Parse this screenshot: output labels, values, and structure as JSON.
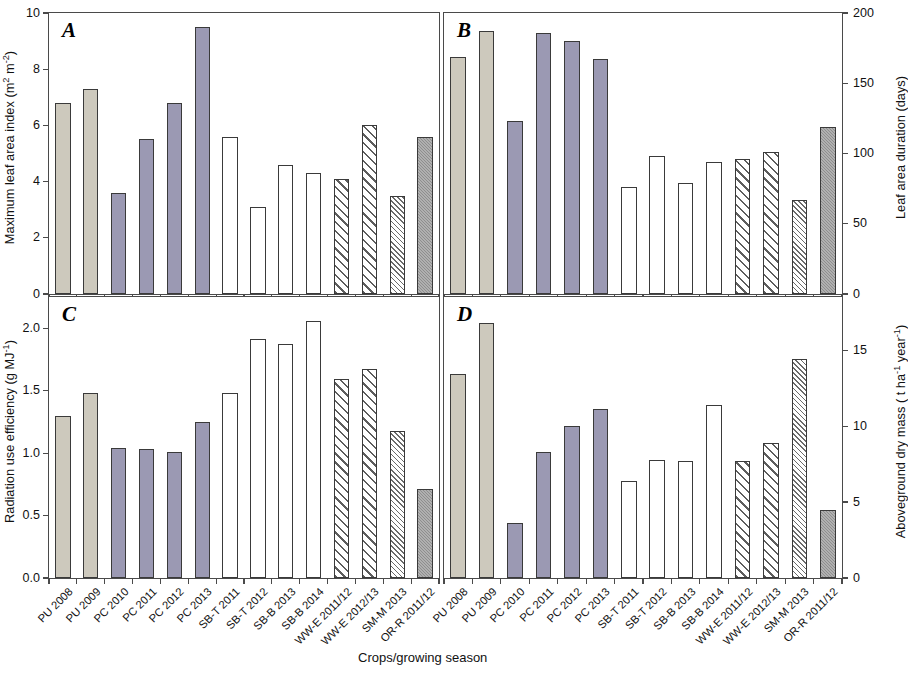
{
  "figure": {
    "xlabel": "Crops/growing season",
    "categories": [
      "PU 2008",
      "PU 2009",
      "PC 2010",
      "PC 2011",
      "PC 2012",
      "PC 2013",
      "SB-T 2011",
      "SB-T 2012",
      "SB-B 2013",
      "SB-B 2014",
      "WW-E 2011/12",
      "WW-E 2012/13",
      "SM-M 2013",
      "OR-R 2011/12"
    ],
    "fills": [
      "beige",
      "beige",
      "purple",
      "purple",
      "purple",
      "purple",
      "white",
      "white",
      "white",
      "white",
      "hatch-coarse",
      "hatch-coarse",
      "hatch-fine",
      "gray"
    ],
    "colors": {
      "beige": "#cdc9bd",
      "purple": "#9b99b3",
      "white": "#ffffff",
      "gray": "#8e8e8e",
      "hatch_coarse": "#5d5d5d",
      "hatch_fine": "#6b6b6b",
      "axis": "#4a4a4a"
    }
  },
  "chart_data": [
    {
      "type": "bar",
      "panel": "A",
      "title": "A",
      "ylabel": "Maximum leaf area index (m2 m-2)",
      "ylabel_html": "Maximum leaf area index (m<sup>2</sup> m<sup>-2</sup>)",
      "xlabel": "Crops/growing season",
      "axis_side": "left",
      "ylim": [
        0,
        10
      ],
      "yticks": [
        0,
        2,
        4,
        6,
        8,
        10
      ],
      "ytick_labels": [
        "0",
        "2",
        "4",
        "6",
        "8",
        "10"
      ],
      "grid": false,
      "legend": "none",
      "categories": [
        "PU 2008",
        "PU 2009",
        "PC 2010",
        "PC 2011",
        "PC 2012",
        "PC 2013",
        "SB-T 2011",
        "SB-T 2012",
        "SB-B 2013",
        "SB-B 2014",
        "WW-E 2011/12",
        "WW-E 2012/13",
        "SM-M 2013",
        "OR-R 2011/12"
      ],
      "values": [
        6.8,
        7.3,
        3.6,
        5.5,
        6.8,
        9.5,
        5.6,
        3.1,
        4.6,
        4.3,
        4.1,
        6.0,
        3.5,
        5.6
      ]
    },
    {
      "type": "bar",
      "panel": "B",
      "title": "B",
      "ylabel": "Leaf area duration (days)",
      "ylabel_html": "Leaf area duration (days)",
      "xlabel": "Crops/growing season",
      "axis_side": "right",
      "ylim": [
        0,
        200
      ],
      "yticks": [
        0,
        50,
        100,
        150,
        200
      ],
      "ytick_labels": [
        "0",
        "50",
        "100",
        "150",
        "200"
      ],
      "grid": false,
      "legend": "none",
      "categories": [
        "PU 2008",
        "PU 2009",
        "PC 2010",
        "PC 2011",
        "PC 2012",
        "PC 2013",
        "SB-T 2011",
        "SB-T 2012",
        "SB-B 2013",
        "SB-B 2014",
        "WW-E 2011/12",
        "WW-E 2012/13",
        "SM-M 2013",
        "OR-R 2011/12"
      ],
      "values": [
        169,
        187,
        123,
        186,
        180,
        167,
        76,
        98,
        79,
        94,
        96,
        101,
        67,
        119
      ]
    },
    {
      "type": "bar",
      "panel": "C",
      "title": "C",
      "ylabel": "Radiation use efficiency (g MJ-1)",
      "ylabel_html": "Radiation use efficiency (g MJ<sup>-1</sup>)",
      "xlabel": "Crops/growing season",
      "axis_side": "left",
      "ylim": [
        0,
        2.25
      ],
      "yticks": [
        0.0,
        0.5,
        1.0,
        1.5,
        2.0
      ],
      "ytick_labels": [
        "0.0",
        "0.5",
        "1.0",
        "1.5",
        "2.0"
      ],
      "grid": false,
      "legend": "none",
      "categories": [
        "PU 2008",
        "PU 2009",
        "PC 2010",
        "PC 2011",
        "PC 2012",
        "PC 2013",
        "SB-T 2011",
        "SB-T 2012",
        "SB-B 2013",
        "SB-B 2014",
        "WW-E 2011/12",
        "WW-E 2012/13",
        "SM-M 2013",
        "OR-R 2011/12"
      ],
      "values": [
        1.3,
        1.48,
        1.04,
        1.03,
        1.01,
        1.25,
        1.48,
        1.91,
        1.87,
        2.06,
        1.59,
        1.67,
        1.18,
        0.71
      ]
    },
    {
      "type": "bar",
      "panel": "D",
      "title": "D",
      "ylabel": "Aboveground dry mass ( t ha-1 year-1)",
      "ylabel_html": "Aboveground dry mass ( t ha<sup>-1</sup> year<sup>-1</sup>)",
      "xlabel": "Crops/growing season",
      "axis_side": "right",
      "ylim": [
        0,
        18.5
      ],
      "yticks": [
        0,
        5,
        10,
        15
      ],
      "ytick_labels": [
        "0",
        "5",
        "10",
        "15"
      ],
      "grid": false,
      "legend": "none",
      "categories": [
        "PU 2008",
        "PU 2009",
        "PC 2010",
        "PC 2011",
        "PC 2012",
        "PC 2013",
        "SB-T 2011",
        "SB-T 2012",
        "SB-B 2013",
        "SB-B 2014",
        "WW-E 2011/12",
        "WW-E 2012/13",
        "SM-M 2013",
        "OR-R 2011/12"
      ],
      "values": [
        13.4,
        16.8,
        3.6,
        8.3,
        10.0,
        11.1,
        6.4,
        7.8,
        7.7,
        11.4,
        7.7,
        8.9,
        14.4,
        4.5
      ]
    }
  ]
}
